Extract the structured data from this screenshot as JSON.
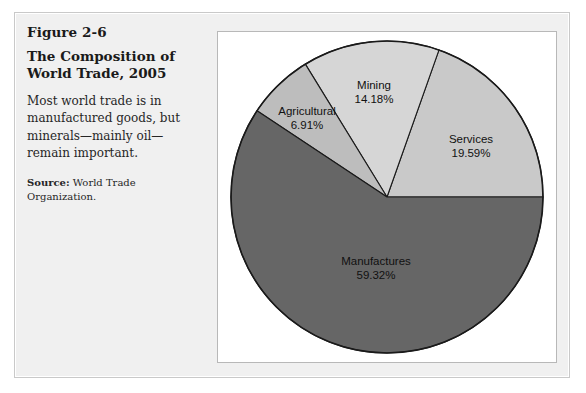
{
  "figure": {
    "number": "Figure 2-6",
    "title": "The Composition of World Trade, 2005",
    "description": "Most world trade is in manufactured goods, but minerals—mainly oil—remain important.",
    "source_label": "Source:",
    "source_text": "World Trade Organization."
  },
  "colors": {
    "panel_background": "#f0f0f0",
    "chart_background": "#ffffff",
    "manufactures": "#666666",
    "services": "#c9c9c9",
    "mining": "#d6d6d6",
    "agricultural": "#bdbdbd",
    "outline": "#1a1a1a"
  },
  "chart_data": {
    "type": "pie",
    "title": "The Composition of World Trade, 2005",
    "subtitle": "",
    "xlabel": "",
    "ylabel": "",
    "legend_position": "none",
    "grid": false,
    "units": "percent",
    "start_angle_deg": 0,
    "direction": "counterclockwise",
    "categories": [
      "Services",
      "Mining",
      "Agricultural",
      "Manufactures"
    ],
    "values": [
      19.59,
      14.18,
      6.91,
      59.32
    ],
    "slices": [
      {
        "name": "Services",
        "value": 19.59,
        "label": "Services",
        "value_label": "19.59%",
        "color": "#c9c9c9"
      },
      {
        "name": "Mining",
        "value": 14.18,
        "label": "Mining",
        "value_label": "14.18%",
        "color": "#d6d6d6"
      },
      {
        "name": "Agricultural",
        "value": 6.91,
        "label": "Agricultural",
        "value_label": "6.91%",
        "color": "#bdbdbd"
      },
      {
        "name": "Manufactures",
        "value": 59.32,
        "label": "Manufactures",
        "value_label": "59.32%",
        "color": "#666666"
      }
    ],
    "total": 100.0
  }
}
